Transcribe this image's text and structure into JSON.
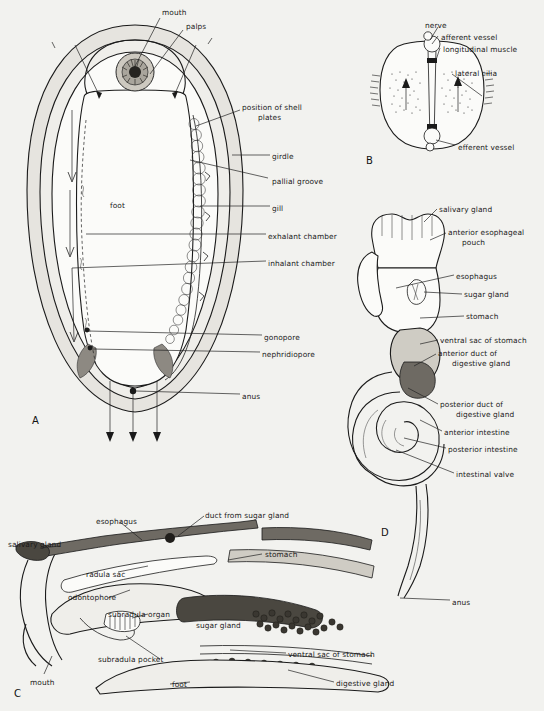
{
  "figure": {
    "background_color": "#f2f2ef",
    "ink_color": "#1a1a1a"
  },
  "panels": [
    {
      "id": "A",
      "letter": "A",
      "caption": "ventral view of chiton showing mantle cavity, gills and water currents",
      "labels": [
        {
          "text": "mouth",
          "x": 162,
          "y": 8
        },
        {
          "text": "palps",
          "x": 186,
          "y": 22
        },
        {
          "text": "position of shell",
          "x": 242,
          "y": 103
        },
        {
          "text": "plates",
          "x": 258,
          "y": 113
        },
        {
          "text": "girdle",
          "x": 272,
          "y": 152
        },
        {
          "text": "pallial groove",
          "x": 272,
          "y": 177
        },
        {
          "text": "gill",
          "x": 272,
          "y": 204
        },
        {
          "text": "exhalant chamber",
          "x": 268,
          "y": 232
        },
        {
          "text": "inhalant chamber",
          "x": 268,
          "y": 259
        },
        {
          "text": "foot",
          "x": 110,
          "y": 201
        },
        {
          "text": "gonopore",
          "x": 264,
          "y": 333
        },
        {
          "text": "nephridiopore",
          "x": 262,
          "y": 350
        },
        {
          "text": "anus",
          "x": 242,
          "y": 392
        }
      ]
    },
    {
      "id": "B",
      "letter": "B",
      "caption": "transverse section of a gill filament",
      "labels": [
        {
          "text": "nerve",
          "x": 425,
          "y": 21
        },
        {
          "text": "afferent vessel",
          "x": 441,
          "y": 33
        },
        {
          "text": "longitudinal muscle",
          "x": 443,
          "y": 45
        },
        {
          "text": "lateral cilia",
          "x": 455,
          "y": 69
        },
        {
          "text": "efferent vessel",
          "x": 458,
          "y": 143
        }
      ]
    },
    {
      "id": "C",
      "letter": "C",
      "caption": "sagittal section through the buccal region and stomach",
      "labels": [
        {
          "text": "esophagus",
          "x": 96,
          "y": 517
        },
        {
          "text": "duct from sugar gland",
          "x": 205,
          "y": 511
        },
        {
          "text": "salivary gland",
          "x": 8,
          "y": 540
        },
        {
          "text": "stomach",
          "x": 265,
          "y": 550
        },
        {
          "text": "radula sac",
          "x": 86,
          "y": 570
        },
        {
          "text": "odontophore",
          "x": 68,
          "y": 593
        },
        {
          "text": "subradula organ",
          "x": 108,
          "y": 610
        },
        {
          "text": "sugar gland",
          "x": 196,
          "y": 621
        },
        {
          "text": "subradula pocket",
          "x": 98,
          "y": 655
        },
        {
          "text": "ventral sac of stomach",
          "x": 288,
          "y": 650
        },
        {
          "text": "foot",
          "x": 172,
          "y": 680
        },
        {
          "text": "digestive gland",
          "x": 336,
          "y": 679
        },
        {
          "text": "mouth",
          "x": 30,
          "y": 678
        }
      ]
    },
    {
      "id": "D",
      "letter": "D",
      "caption": "dissected alimentary canal showing coiled intestine",
      "labels": [
        {
          "text": "salivary gland",
          "x": 439,
          "y": 205
        },
        {
          "text": "anterior esophageal",
          "x": 448,
          "y": 228
        },
        {
          "text": "pouch",
          "x": 462,
          "y": 238
        },
        {
          "text": "esophagus",
          "x": 456,
          "y": 272
        },
        {
          "text": "sugar gland",
          "x": 464,
          "y": 290
        },
        {
          "text": "stomach",
          "x": 466,
          "y": 312
        },
        {
          "text": "ventral sac of stomach",
          "x": 440,
          "y": 336
        },
        {
          "text": "anterior duct of",
          "x": 438,
          "y": 349
        },
        {
          "text": "digestive gland",
          "x": 452,
          "y": 359
        },
        {
          "text": "posterior duct of",
          "x": 440,
          "y": 400
        },
        {
          "text": "digestive gland",
          "x": 456,
          "y": 410
        },
        {
          "text": "anterior intestine",
          "x": 444,
          "y": 428
        },
        {
          "text": "posterior intestine",
          "x": 448,
          "y": 445
        },
        {
          "text": "intestinal valve",
          "x": 456,
          "y": 470
        },
        {
          "text": "anus",
          "x": 452,
          "y": 598
        }
      ]
    }
  ]
}
